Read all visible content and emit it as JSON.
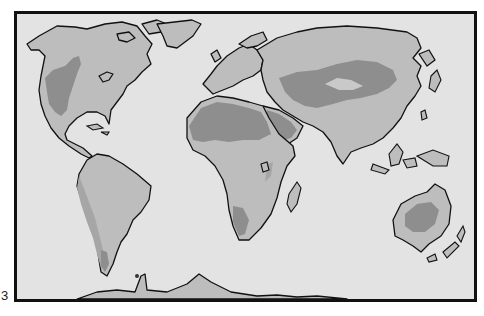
{
  "figure": {
    "label": "3"
  },
  "map": {
    "projection": "world",
    "colors": {
      "ocean": "#e3e3e3",
      "land": "#bdbdbd",
      "desert": "#8e8e8e",
      "semi_arid": "#a6a6a6",
      "outline": "#111111",
      "frame": "#111111"
    },
    "regions": [
      {
        "name": "North America",
        "desert_areas": [
          "Great Basin",
          "Mojave / Sonoran"
        ]
      },
      {
        "name": "South America",
        "desert_areas": [
          "Atacama",
          "Patagonia"
        ]
      },
      {
        "name": "Africa",
        "desert_areas": [
          "Sahara",
          "Kalahari / Namib"
        ]
      },
      {
        "name": "Arabia",
        "desert_areas": [
          "Arabian Desert"
        ]
      },
      {
        "name": "Asia",
        "desert_areas": [
          "Central Asian deserts",
          "Gobi",
          "Taklamakan",
          "Thar"
        ]
      },
      {
        "name": "Australia",
        "desert_areas": [
          "Great Victoria / Great Sandy"
        ]
      },
      {
        "name": "Europe",
        "desert_areas": []
      },
      {
        "name": "Antarctica",
        "desert_areas": []
      }
    ]
  }
}
